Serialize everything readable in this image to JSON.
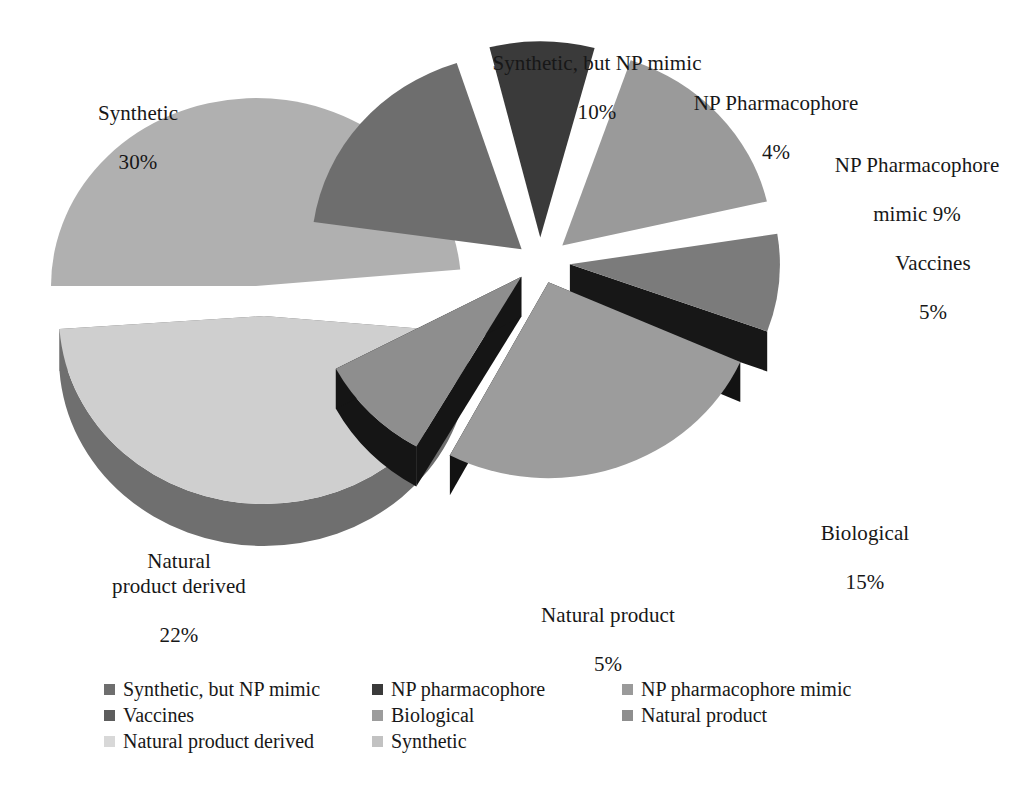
{
  "chart_data": {
    "type": "pie",
    "title": "",
    "subtitle": "",
    "xlabel": "",
    "ylabel": "",
    "grid": false,
    "legend_position": "bottom",
    "note": "3D exploded pie chart split into two groups; left group shows the two largest slices, right group shows the six smaller slices.",
    "categories": [
      "Synthetic, but NP mimic",
      "NP pharmacophore",
      "NP pharmacophore mimic",
      "Vaccines",
      "Biological",
      "Natural product",
      "Natural product derived",
      "Synthetic"
    ],
    "values": [
      10,
      4,
      9,
      5,
      15,
      5,
      22,
      30
    ],
    "unit": "%",
    "slices": [
      {
        "name": "Synthetic, but NP mimic",
        "callout_label": "Synthetic, but NP mimic",
        "callout_value": "10%",
        "value": 10,
        "color": "#6e6e6e",
        "side_color": "#232323",
        "group": "right"
      },
      {
        "name": "NP pharmacophore",
        "callout_label": "NP Pharmacophore",
        "callout_value": "4%",
        "value": 4,
        "color": "#3a3a3a",
        "side_color": "#141414",
        "group": "right"
      },
      {
        "name": "NP pharmacophore mimic",
        "callout_label": "NP Pharmacophore",
        "callout_value": "mimic 9%",
        "value": 9,
        "color": "#9a9a9a",
        "side_color": "#1c1c1c",
        "group": "right"
      },
      {
        "name": "Vaccines",
        "callout_label": "Vaccines",
        "callout_value": "5%",
        "value": 5,
        "color": "#7b7b7b",
        "side_color": "#171717",
        "group": "right"
      },
      {
        "name": "Biological",
        "callout_label": "Biological",
        "callout_value": "15%",
        "value": 15,
        "color": "#9c9c9c",
        "side_color": "#121212",
        "group": "right"
      },
      {
        "name": "Natural product",
        "callout_label": "Natural product",
        "callout_value": "5%",
        "value": 5,
        "color": "#8e8e8e",
        "side_color": "#151515",
        "group": "right"
      },
      {
        "name": "Natural product derived",
        "callout_label": "Natural\nproduct derived",
        "callout_value": "22%",
        "value": 22,
        "color": "#cfcfcf",
        "side_color": "#6f6f6f",
        "group": "left"
      },
      {
        "name": "Synthetic",
        "callout_label": "Synthetic",
        "callout_value": "30%",
        "value": 30,
        "color": "#b0b0b0",
        "side_color": "#0d0d0d",
        "group": "left"
      }
    ]
  },
  "callouts": [
    {
      "id": "synthetic",
      "label": "Synthetic",
      "value": "30%"
    },
    {
      "id": "natural-product-derived",
      "label": "Natural\nproduct derived",
      "value": "22%"
    },
    {
      "id": "synthetic-np-mimic",
      "label": "Synthetic, but NP mimic",
      "value": "10%"
    },
    {
      "id": "np-pharmacophore",
      "label": "NP Pharmacophore",
      "value": "4%"
    },
    {
      "id": "np-pharmacophore-mimic",
      "label": "NP Pharmacophore",
      "value": "mimic 9%"
    },
    {
      "id": "vaccines",
      "label": "Vaccines",
      "value": "5%"
    },
    {
      "id": "biological",
      "label": "Biological",
      "value": "15%"
    },
    {
      "id": "natural-product",
      "label": "Natural product",
      "value": "5%"
    }
  ],
  "legend": {
    "items": [
      {
        "label": "Synthetic, but NP mimic",
        "color": "#6e6e6e"
      },
      {
        "label": "NP pharmacophore",
        "color": "#3a3a3a"
      },
      {
        "label": "NP pharmacophore mimic",
        "color": "#9a9a9a"
      },
      {
        "label": "Vaccines",
        "color": "#5d5d5d"
      },
      {
        "label": "Biological",
        "color": "#9c9c9c"
      },
      {
        "label": "Natural product",
        "color": "#8e8e8e"
      },
      {
        "label": "Natural product derived",
        "color": "#d8d8d8"
      },
      {
        "label": "Synthetic",
        "color": "#c2c2c2"
      }
    ]
  }
}
